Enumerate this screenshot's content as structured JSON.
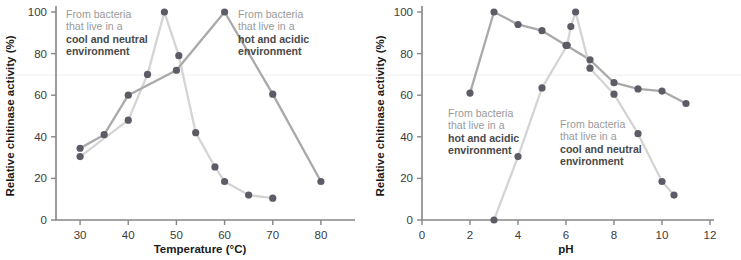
{
  "figure": {
    "panels": [
      {
        "id": "temperature",
        "xlabel": "Temperature (°C)",
        "ylabel": "Relative chitinase activity (%)",
        "annotations": [
          {
            "line1": "From bacteria",
            "line2": "that live in a",
            "line3": "cool and neutral",
            "line4": "environment"
          },
          {
            "line1": "From bacteria",
            "line2": "that live in a",
            "line3": "hot and acidic",
            "line4": "environment"
          }
        ]
      },
      {
        "id": "ph",
        "xlabel": "pH",
        "ylabel": "Relative chitinase activity (%)",
        "annotations": [
          {
            "line1": "From bacteria",
            "line2": "that live in a",
            "line3": "hot and acidic",
            "line4": "environment"
          },
          {
            "line1": "From bacteria",
            "line2": "that live in a",
            "line3": "cool and neutral",
            "line4": "environment"
          }
        ]
      }
    ],
    "colors": {
      "cool_line": "#d4d4d4",
      "hot_line": "#a9a9a9",
      "marker": "#5c5c66",
      "axis": "#868686",
      "annotation_text": "#9a9a9a",
      "annotation_bold": "#4a4a4a"
    }
  },
  "chart_data": [
    {
      "type": "line",
      "title": "",
      "xlabel": "Temperature (°C)",
      "ylabel": "Relative chitinase activity (%)",
      "xlim": [
        25,
        85
      ],
      "ylim": [
        0,
        100
      ],
      "xticks": [
        30,
        40,
        50,
        60,
        70,
        80
      ],
      "yticks": [
        0,
        20,
        40,
        60,
        80,
        100
      ],
      "xtick_labels": [
        "30",
        "40",
        "50",
        "60",
        "70",
        "80"
      ],
      "ytick_labels": [
        "0",
        "20",
        "40",
        "60",
        "80",
        "100"
      ],
      "grid": false,
      "legend": "annotations on plot",
      "series": [
        {
          "name": "From bacteria that live in a cool and neutral environment",
          "color": "#d4d4d4",
          "x": [
            30,
            40,
            44,
            47.5,
            50.5,
            54,
            58,
            60,
            65,
            70
          ],
          "y": [
            30.5,
            48,
            70,
            100,
            79,
            42,
            25.5,
            18.5,
            12,
            10.5
          ]
        },
        {
          "name": "From bacteria that live in a hot and acidic environment",
          "color": "#a9a9a9",
          "x": [
            30,
            35,
            40,
            50,
            60,
            70,
            80
          ],
          "y": [
            34.5,
            41,
            60,
            72,
            100,
            60.5,
            18.5
          ]
        }
      ]
    },
    {
      "type": "line",
      "title": "",
      "xlabel": "pH",
      "ylabel": "Relative chitinase activity (%)",
      "xlim": [
        0,
        12
      ],
      "ylim": [
        0,
        100
      ],
      "xticks": [
        0,
        2,
        4,
        6,
        8,
        10,
        12
      ],
      "yticks": [
        0,
        20,
        40,
        60,
        80,
        100
      ],
      "xtick_labels": [
        "0",
        "2",
        "4",
        "6",
        "8",
        "10",
        "12"
      ],
      "ytick_labels": [
        "0",
        "20",
        "40",
        "60",
        "80",
        "100"
      ],
      "grid": false,
      "legend": "annotations on plot",
      "series": [
        {
          "name": "From bacteria that live in a hot and acidic environment",
          "color": "#a9a9a9",
          "x": [
            2,
            3,
            4,
            5,
            6,
            7,
            8,
            9,
            10,
            11
          ],
          "y": [
            61,
            100,
            94,
            91,
            84,
            77,
            66,
            63,
            62,
            56
          ]
        },
        {
          "name": "From bacteria that live in a cool and neutral environment",
          "color": "#d4d4d4",
          "x": [
            3,
            4,
            5,
            6.05,
            6.2,
            6.4,
            7,
            8,
            9,
            10,
            10.5
          ],
          "y": [
            0,
            30.5,
            63.5,
            84,
            93,
            100,
            73,
            60.5,
            41.5,
            18.5,
            12
          ]
        }
      ]
    }
  ]
}
